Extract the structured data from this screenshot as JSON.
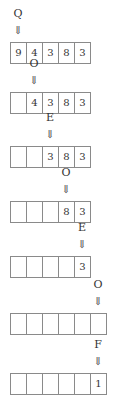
{
  "steps": [
    {
      "label": "Q",
      "label_col": 0,
      "cells": [
        "9",
        "4",
        "3",
        "8",
        "3"
      ],
      "top": 42
    },
    {
      "label": "O",
      "label_col": 1,
      "cells": [
        "",
        "4",
        "3",
        "8",
        "3"
      ],
      "top": 92
    },
    {
      "label": "E",
      "label_col": 2,
      "cells": [
        "",
        "",
        "3",
        "8",
        "3"
      ],
      "top": 146
    },
    {
      "label": "O",
      "label_col": 3,
      "cells": [
        "",
        "",
        "",
        "8",
        "3"
      ],
      "top": 201
    },
    {
      "label": "E",
      "label_col": 4,
      "cells": [
        "",
        "",
        "",
        "",
        "3"
      ],
      "top": 256
    },
    {
      "label": "O",
      "label_col": 5,
      "cells": [
        "",
        "",
        "",
        "",
        "",
        ""
      ],
      "top": 313
    },
    {
      "label": "F",
      "label_col": 5,
      "cells": [
        "",
        "",
        "",
        "",
        "",
        "1"
      ],
      "top": 373
    }
  ],
  "arrow_glyph": "⇓"
}
